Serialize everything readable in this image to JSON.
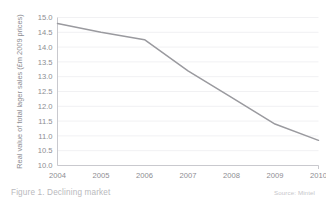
{
  "figure": {
    "caption": "Figure 1. Declining market",
    "source": "Source: Mintel"
  },
  "colors": {
    "line": "#9a9a9f",
    "grid": "#f1f1f3",
    "axis": "#c9c9ce",
    "text": "#8d8d92",
    "caption_text": "#b9b9bd",
    "background": "#ffffff"
  },
  "chart_data": {
    "type": "line",
    "title": "",
    "xlabel": "",
    "ylabel": "Real value of total lager sales (£m 2009 prices)",
    "categories": [
      "2004",
      "2005",
      "2006",
      "2007",
      "2008",
      "2009",
      "2010"
    ],
    "x": [
      2004,
      2005,
      2006,
      2007,
      2008,
      2009,
      2010
    ],
    "values": [
      14.8,
      14.5,
      14.25,
      13.2,
      12.3,
      11.4,
      10.85
    ],
    "series": [
      {
        "name": "Real value of total lager sales",
        "values": [
          14.8,
          14.5,
          14.25,
          13.2,
          12.3,
          11.4,
          10.85
        ]
      }
    ],
    "ylim": [
      10.0,
      15.0
    ],
    "yticks": [
      "15.0",
      "14.5",
      "14.0",
      "13.5",
      "13.0",
      "12.5",
      "12.0",
      "11.5",
      "11.0",
      "10.5",
      "10.0"
    ],
    "ytick_values": [
      15.0,
      14.5,
      14.0,
      13.5,
      13.0,
      12.5,
      12.0,
      11.5,
      11.0,
      10.5,
      10.0
    ],
    "xlim": [
      2004,
      2010
    ],
    "xticks": [
      "2004",
      "2005",
      "2006",
      "2007",
      "2008",
      "2009",
      "2010"
    ],
    "grid": true,
    "grid_axis": "y",
    "legend": false,
    "legend_position": "none",
    "markers": false,
    "annotations": []
  }
}
